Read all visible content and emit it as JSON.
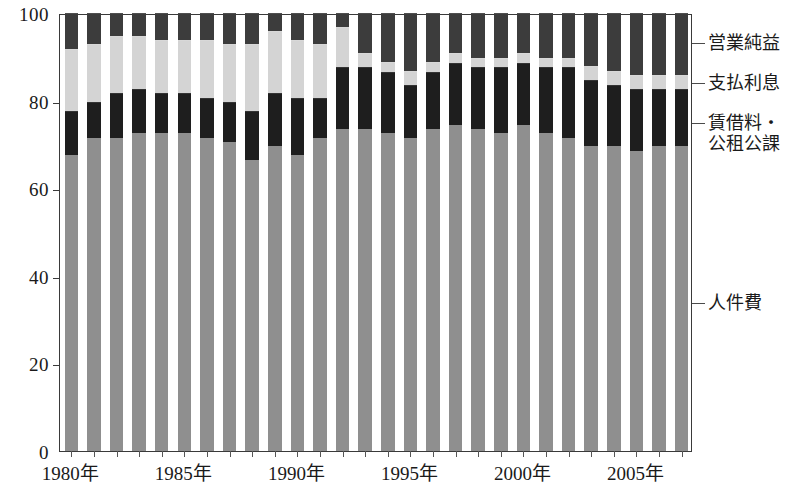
{
  "chart_data": {
    "type": "bar",
    "subtype": "stacked-percentage",
    "title": "",
    "subtitle": "",
    "xlabel": "",
    "ylabel": "",
    "ylim": [
      0,
      100
    ],
    "yticks": [
      0,
      20,
      40,
      60,
      80,
      100
    ],
    "grid": false,
    "legend_position": "right",
    "categories": [
      "1980年",
      "1981年",
      "1982年",
      "1983年",
      "1984年",
      "1985年",
      "1986年",
      "1987年",
      "1988年",
      "1989年",
      "1990年",
      "1991年",
      "1992年",
      "1993年",
      "1994年",
      "1995年",
      "1996年",
      "1997年",
      "1998年",
      "1999年",
      "2000年",
      "2001年",
      "2002年",
      "2003年",
      "2004年",
      "2005年",
      "2006年",
      "2007年"
    ],
    "x_tick_labels": [
      "1980年",
      "1985年",
      "1990年",
      "1995年",
      "2000年",
      "2005年"
    ],
    "x_tick_indices": [
      0,
      5,
      10,
      15,
      20,
      25
    ],
    "series": [
      {
        "name": "人件費",
        "color": "#8f8f8f",
        "values": [
          68,
          72,
          72,
          73,
          73,
          73,
          72,
          71,
          67,
          70,
          68,
          72,
          74,
          74,
          73,
          72,
          74,
          75,
          74,
          73,
          75,
          73,
          72,
          70,
          70,
          69,
          70,
          70
        ]
      },
      {
        "name": "賃借料・公租公課",
        "color": "#1e1e1e",
        "values": [
          10,
          8,
          10,
          10,
          9,
          9,
          9,
          9,
          11,
          12,
          13,
          9,
          14,
          14,
          14,
          12,
          13,
          14,
          14,
          15,
          14,
          15,
          16,
          15,
          14,
          14,
          13,
          13
        ]
      },
      {
        "name": "支払利息",
        "color": "#d4d4d4",
        "values": [
          14,
          13,
          13,
          12,
          12,
          12,
          13,
          13,
          15,
          14,
          13,
          12,
          9,
          3,
          2,
          3,
          2,
          2,
          2,
          2,
          2,
          2,
          2,
          3,
          3,
          3,
          3,
          3
        ]
      },
      {
        "name": "営業純益",
        "color": "#3c3c3c",
        "values": [
          8,
          7,
          5,
          5,
          6,
          6,
          6,
          7,
          7,
          4,
          6,
          7,
          3,
          9,
          11,
          13,
          11,
          9,
          10,
          10,
          9,
          10,
          10,
          12,
          13,
          14,
          14,
          14
        ]
      }
    ]
  },
  "legend": {
    "items": [
      {
        "label": "営業純益",
        "label_line2": ""
      },
      {
        "label": "支払利息",
        "label_line2": ""
      },
      {
        "label": "賃借料・",
        "label_line2": "公租公課"
      },
      {
        "label": "人件費",
        "label_line2": ""
      }
    ]
  },
  "axis": {
    "y_tick_labels": [
      "100",
      "80",
      "60",
      "40",
      "20",
      "0"
    ]
  }
}
